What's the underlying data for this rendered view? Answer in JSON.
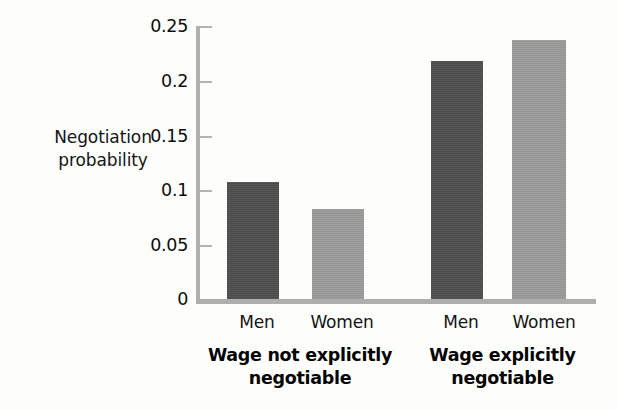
{
  "chart_data": {
    "type": "bar",
    "title": "",
    "subtitle": "",
    "xlabel": "",
    "ylabel": "Negotiation probability",
    "ylabel_line1": "Negotiation",
    "ylabel_line2": "probability",
    "ylim": [
      0,
      0.25
    ],
    "ytick_labels": [
      "0.25",
      "0.2",
      "0.15",
      "0.1",
      "0.05",
      "0"
    ],
    "ytick_values": [
      0.25,
      0.2,
      0.15,
      0.1,
      0.05,
      0
    ],
    "grid": false,
    "legend": "none",
    "categories": [
      "Men",
      "Women"
    ],
    "groups": [
      {
        "label": "Wage not explicitly negotiable",
        "label_line1": "Wage not explicitly",
        "label_line2": "negotiable",
        "bars": [
          {
            "category": "Men",
            "value": 0.107,
            "color": "#4e4e4e"
          },
          {
            "category": "Women",
            "value": 0.082,
            "color": "#9a9a9a"
          }
        ]
      },
      {
        "label": "Wage explicitly negotiable",
        "label_line1": "Wage explicitly",
        "label_line2": "negotiable",
        "bars": [
          {
            "category": "Men",
            "value": 0.217,
            "color": "#4e4e4e"
          },
          {
            "category": "Women",
            "value": 0.236,
            "color": "#9a9a9a"
          }
        ]
      }
    ],
    "series": [
      {
        "name": "Men",
        "values": [
          0.107,
          0.217
        ]
      },
      {
        "name": "Women",
        "values": [
          0.082,
          0.236
        ]
      }
    ],
    "colors": {
      "men_bar": "#4e4e4e",
      "women_bar": "#9a9a9a",
      "axis": "#b0b0ae",
      "text": "#141414",
      "background": "#fdfdfc"
    }
  }
}
